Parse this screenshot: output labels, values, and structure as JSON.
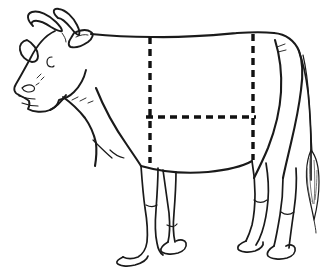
{
  "figure": {
    "orientation": "left-facing side profile",
    "background_color": "#ffffff",
    "outline_color": "#1a1a1a",
    "guide_color": "#111111"
  },
  "parts": {
    "head": "head",
    "horn_left": "left-horn",
    "horn_right": "right-horn",
    "ear_near": "near-ear",
    "ear_far": "far-ear",
    "eye": "eye",
    "muzzle": "muzzle",
    "nostril": "nostril",
    "jaw": "jaw",
    "neck": "neck",
    "topline": "topline",
    "withers": "withers",
    "rump": "rump",
    "belly": "belly",
    "brisket": "brisket",
    "foreleg_near": "near-foreleg",
    "foreleg_far": "far-foreleg",
    "hindleg_near": "near-hindleg",
    "hindleg_far": "far-hindleg",
    "hoof": "hoof",
    "tail": "tail",
    "tail_tuft": "tail-tuft",
    "dewlap": "dewlap"
  },
  "guides": {
    "style": "dashed",
    "dash_pattern": "7 5",
    "stroke_width": 3.4,
    "lines": [
      {
        "name": "front-vertical-guide",
        "orientation": "vertical",
        "x": 150,
        "y1": 37,
        "y2": 163
      },
      {
        "name": "rear-vertical-guide",
        "orientation": "vertical",
        "x": 253,
        "y1": 34,
        "y2": 160
      },
      {
        "name": "mid-horizontal-guide",
        "orientation": "horizontal",
        "y": 117,
        "x1": 146,
        "x2": 256
      }
    ]
  }
}
